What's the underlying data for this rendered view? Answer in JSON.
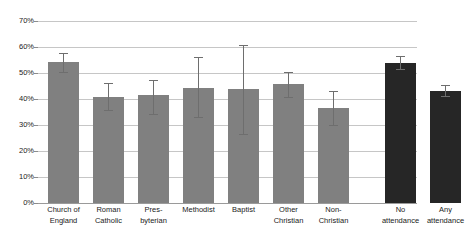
{
  "chart_data": {
    "type": "bar",
    "title": "",
    "subtitle": "",
    "xlabel": "",
    "ylabel": "",
    "ylim": [
      0,
      70
    ],
    "ytick_labels": [
      "0%",
      "10%",
      "20%",
      "30%",
      "40%",
      "50%",
      "60%",
      "70%"
    ],
    "ytick_values": [
      0,
      10,
      20,
      30,
      40,
      50,
      60,
      70
    ],
    "grid": true,
    "legend": "none",
    "group_gap_after_index": 6,
    "categories": [
      "Church of England",
      "Roman Catholic",
      "Presbyterian",
      "Methodist",
      "Baptist",
      "Other Christian",
      "Non-Christian",
      "No attendance",
      "Any attendance"
    ],
    "category_label_lines": [
      [
        "Church of",
        "England"
      ],
      [
        "Roman",
        "Catholic"
      ],
      [
        "Pres-",
        "byterian"
      ],
      [
        "Methodist",
        ""
      ],
      [
        "Baptist",
        ""
      ],
      [
        "Other",
        "Christian"
      ],
      [
        "Non-",
        "Christian"
      ],
      [
        "No",
        "attendance"
      ],
      [
        "Any",
        "attendance"
      ]
    ],
    "values": [
      54.2,
      40.8,
      41.6,
      44.2,
      44.0,
      45.6,
      36.5,
      53.8,
      43.2
    ],
    "error_low": [
      50.4,
      35.6,
      34.4,
      33.2,
      26.5,
      40.6,
      30.0,
      51.5,
      41.2
    ],
    "error_high": [
      57.7,
      46.0,
      47.2,
      56.0,
      60.8,
      50.5,
      43.2,
      56.4,
      45.4
    ],
    "series_colors": [
      "#808080",
      "#262626"
    ],
    "bar_color_index": [
      0,
      0,
      0,
      0,
      0,
      0,
      0,
      1,
      1
    ],
    "errorbar_color": "#6e6e6e",
    "gridline_color": "#c6c6c6"
  }
}
